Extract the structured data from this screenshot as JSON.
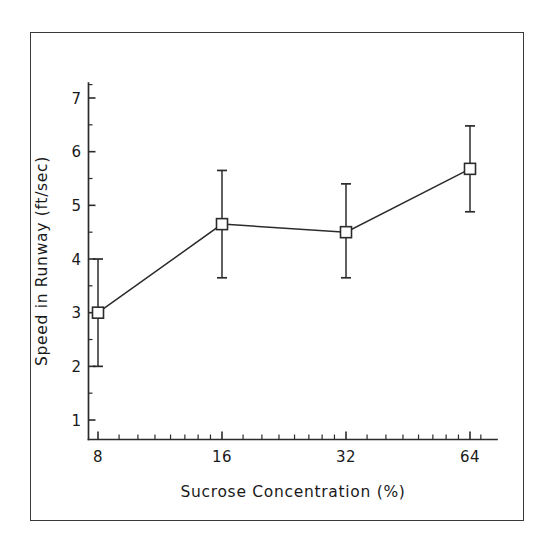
{
  "chart_data": {
    "type": "line",
    "title": "",
    "subtitle": "",
    "xlabel": "Sucrose Concentration (%)",
    "ylabel": "Speed in Runway (ft/sec)",
    "xscale": "log2",
    "x": [
      8,
      16,
      32,
      64
    ],
    "xtick_labels": [
      "8",
      "16",
      "32",
      "64"
    ],
    "ytick_labels": [
      "1",
      "2",
      "3",
      "4",
      "5",
      "6",
      "7"
    ],
    "yticks": [
      1,
      2,
      3,
      4,
      5,
      6,
      7
    ],
    "xlim": [
      7.2,
      72
    ],
    "ylim": [
      0.65,
      7.35
    ],
    "grid": false,
    "legend": false,
    "legend_position": "none",
    "marker": "open-square",
    "series": [
      {
        "name": "Mean speed in runway",
        "values": [
          3.0,
          4.65,
          4.5,
          5.68
        ],
        "error_low": [
          2.0,
          3.65,
          3.65,
          4.88
        ],
        "error_high": [
          4.0,
          5.65,
          5.4,
          6.48
        ],
        "error_minus": [
          1.0,
          1.0,
          0.85,
          0.8
        ],
        "error_plus": [
          1.0,
          1.0,
          0.9,
          0.8
        ]
      }
    ],
    "annotations": []
  },
  "axes": {
    "x_minor_ticks": [
      9,
      10,
      11,
      12,
      13,
      14,
      15,
      18,
      20,
      22,
      24,
      26,
      28,
      30,
      36,
      40,
      44,
      48,
      52,
      56,
      60,
      68
    ],
    "y_minor_ticks": [
      1.5,
      2.5,
      3.5,
      4.5,
      5.5,
      6.5,
      7.25
    ]
  },
  "colors": {
    "line": "#2b2b2b",
    "marker_face": "#ffffff",
    "marker_edge": "#2b2b2b",
    "frame": "#3a3a3a",
    "background": "#ffffff",
    "text": "#1a1a1a"
  }
}
